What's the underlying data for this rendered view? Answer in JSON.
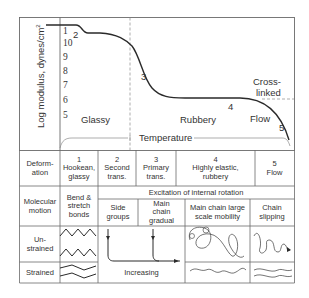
{
  "chart": {
    "y_axis_label": "Log modulus, dynes/cm",
    "y_axis_exp": "2",
    "y_ticks": [
      "10",
      "9",
      "8",
      "7",
      "6",
      "5"
    ],
    "top_tick": "1",
    "curve_labels": [
      "2",
      "3",
      "4",
      "5"
    ],
    "regions": {
      "glassy": "Glassy",
      "rubbery": "Rubbery",
      "flow": "Flow",
      "cross_linked_line1": "Cross-",
      "cross_linked_line2": "linked"
    },
    "x_axis_label": "Temperature"
  },
  "table": {
    "row_labels": {
      "deformation_line1": "Deform-",
      "deformation_line2": "ation",
      "molecular_line1": "Molecular",
      "molecular_line2": "motion",
      "unstrained_line1": "Un-",
      "unstrained_line2": "strained",
      "strained": "Strained"
    },
    "deformation": [
      {
        "num": "1",
        "line1": "Hookean,",
        "line2": "glassy"
      },
      {
        "num": "2",
        "line1": "Second",
        "line2": "trans."
      },
      {
        "num": "3",
        "line1": "Primary",
        "line2": "trans."
      },
      {
        "num": "4",
        "line1": "Highly elastic,",
        "line2": "rubbery"
      },
      {
        "num": "5",
        "line1": "Flow",
        "line2": ""
      }
    ],
    "molecular": {
      "bend_line1": "Bend &",
      "bend_line2": "stretch",
      "bend_line3": "bonds",
      "excitation": "Excitation of internal rotation",
      "side_line1": "Side",
      "side_line2": "groups",
      "gradual_line1": "Main",
      "gradual_line2": "chain",
      "gradual_line3": "gradual",
      "large_line1": "Main chain large",
      "large_line2": "scale mobility",
      "slip_line1": "Chain",
      "slip_line2": "slipping"
    },
    "increasing": "Increasing"
  },
  "colors": {
    "line": "#3a3a3a",
    "grid": "#6a6a6a",
    "dash": "#8a8a8a"
  }
}
